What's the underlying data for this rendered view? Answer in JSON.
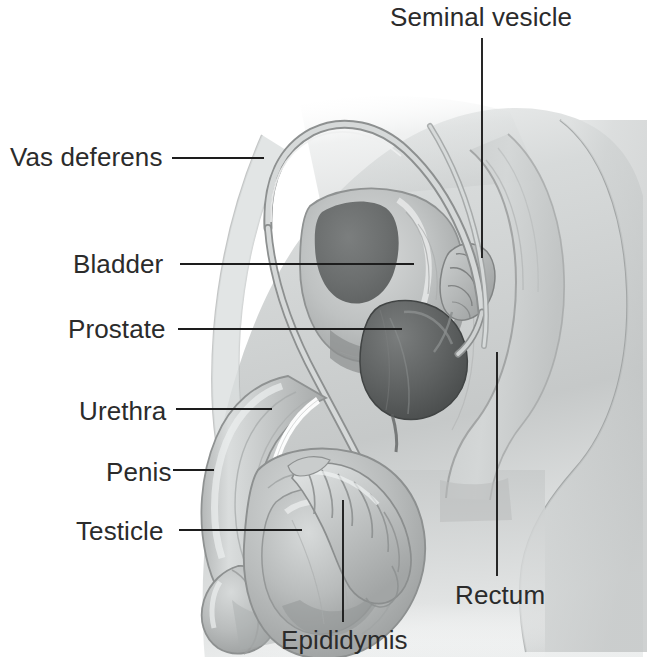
{
  "figure": {
    "background_color": "#ffffff",
    "text_color": "#2b2b2b",
    "leader_line_color": "#1d1d1d",
    "body_fill": "#cfd2d2",
    "body_shadow": "#a8abab",
    "organ_dark": "#6b6e6e",
    "organ_darkest": "#4e5151",
    "tube_fill": "#c3c6c6",
    "tube_stroke": "#8d9090"
  },
  "labels": {
    "seminal_vesicle": {
      "text": "Seminal vesicle",
      "x": 390,
      "y": 4,
      "leader": {
        "x1": 482,
        "y1": 38,
        "x2": 482,
        "y2": 258
      }
    },
    "vas_deferens": {
      "text": "Vas deferens",
      "x": 10,
      "y": 144,
      "leader": {
        "x1": 172,
        "y1": 158,
        "x2": 264,
        "y2": 158
      }
    },
    "bladder": {
      "text": "Bladder",
      "x": 73,
      "y": 251,
      "leader": {
        "x1": 180,
        "y1": 264,
        "x2": 414,
        "y2": 264
      }
    },
    "prostate": {
      "text": "Prostate",
      "x": 68,
      "y": 316,
      "leader": {
        "x1": 178,
        "y1": 329,
        "x2": 402,
        "y2": 329
      }
    },
    "urethra": {
      "text": "Urethra",
      "x": 79,
      "y": 398,
      "leader": {
        "x1": 176,
        "y1": 409,
        "x2": 272,
        "y2": 409
      }
    },
    "penis": {
      "text": "Penis",
      "x": 106,
      "y": 459,
      "leader": {
        "x1": 173,
        "y1": 470,
        "x2": 214,
        "y2": 470
      }
    },
    "testicle": {
      "text": "Testicle",
      "x": 76,
      "y": 518,
      "leader": {
        "x1": 179,
        "y1": 530,
        "x2": 302,
        "y2": 530
      }
    },
    "epididymis": {
      "text": "Epididymis",
      "x": 281,
      "y": 627,
      "leader": {
        "x1": 343,
        "y1": 500,
        "x2": 343,
        "y2": 622
      }
    },
    "rectum": {
      "text": "Rectum",
      "x": 455,
      "y": 582,
      "leader": {
        "x1": 497,
        "y1": 352,
        "x2": 497,
        "y2": 576
      }
    }
  }
}
